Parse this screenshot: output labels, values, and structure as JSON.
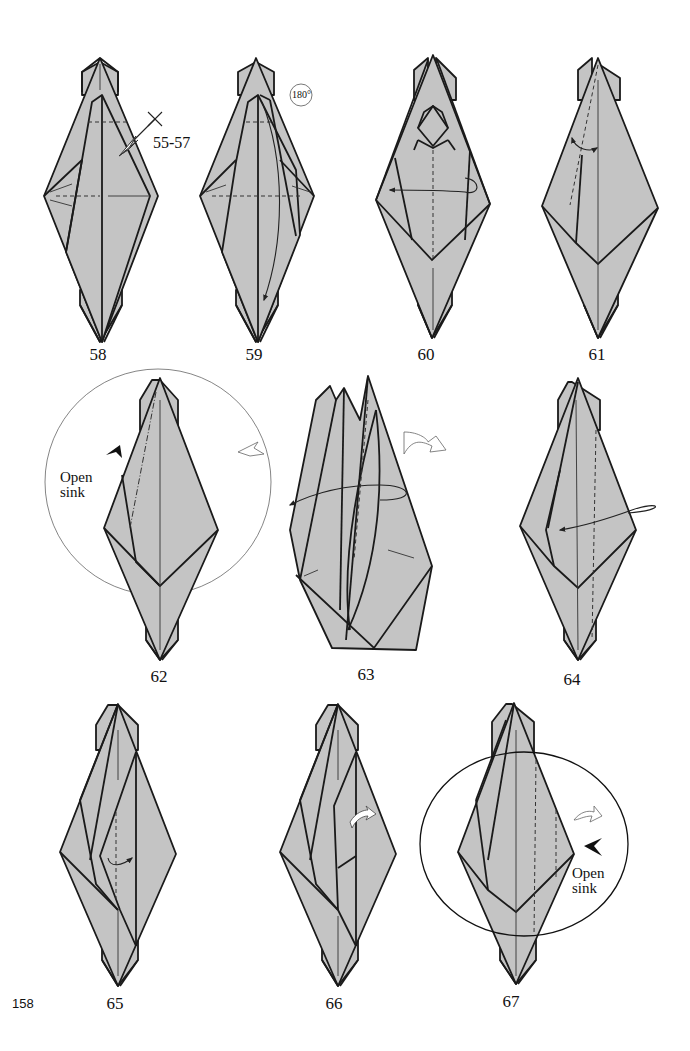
{
  "page": {
    "page_number": "158",
    "paper_color": "#c4c4c4",
    "line_color": "#1a1a1a"
  },
  "steps": [
    {
      "number": "58",
      "annotation": "55-57"
    },
    {
      "number": "59",
      "annotation": "180°"
    },
    {
      "number": "60",
      "annotation": ""
    },
    {
      "number": "61",
      "annotation": ""
    },
    {
      "number": "62",
      "annotation": "Open sink"
    },
    {
      "number": "63",
      "annotation": ""
    },
    {
      "number": "64",
      "annotation": ""
    },
    {
      "number": "65",
      "annotation": ""
    },
    {
      "number": "66",
      "annotation": ""
    },
    {
      "number": "67",
      "annotation": "Open sink"
    }
  ],
  "notes": {
    "step58_ref": "55-57",
    "step59_rotate": "180°",
    "step62_line1": "Open",
    "step62_line2": "sink",
    "step67_line1": "Open",
    "step67_line2": "sink"
  }
}
